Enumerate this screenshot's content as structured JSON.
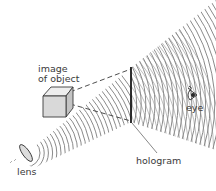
{
  "diagram": {
    "labels": {
      "image_line1": "image",
      "image_line2": "of object",
      "eye": "eye",
      "hologram": "hologram",
      "lens": "lens"
    },
    "colors": {
      "ink": "#3a3a3a",
      "waves": "#8a8a8a",
      "cube_front": "#d9d9d9",
      "cube_top": "#eeeeee",
      "cube_side": "#c4c4c4",
      "lens_fill": "#dcdcdc"
    },
    "elements": [
      {
        "name": "lens",
        "type": "optical-element"
      },
      {
        "name": "reference-beam",
        "type": "wavefronts"
      },
      {
        "name": "hologram",
        "type": "plate"
      },
      {
        "name": "image-of-object",
        "type": "cube"
      },
      {
        "name": "diffracted-waves",
        "type": "wavefronts"
      },
      {
        "name": "eye",
        "type": "observer"
      }
    ]
  }
}
